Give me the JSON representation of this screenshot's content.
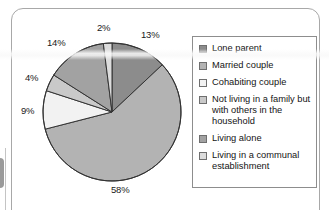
{
  "chart_data": {
    "type": "pie",
    "title": "",
    "subtitle": "",
    "xlabel": "",
    "ylabel": "",
    "legend_position": "right",
    "grid": false,
    "unit": "%",
    "categories": [
      "Lone parent",
      "Married couple",
      "Cohabiting couple",
      "Not living in a family but with others in the household",
      "Living alone",
      "Living in a communal establishment"
    ],
    "values": [
      13,
      58,
      9,
      4,
      14,
      2
    ],
    "data_labels": [
      "13%",
      "58%",
      "9%",
      "4%",
      "14%",
      "2%"
    ],
    "colors": [
      "#8c8c8c",
      "#b3b3b3",
      "#f2f2f2",
      "#c9c9c9",
      "#a2a2a2",
      "#dcdcdc"
    ],
    "slice_order_clockwise_from_top": [
      "Lone parent",
      "Married couple",
      "Cohabiting couple",
      "Not living in a family but with others in the household",
      "Living alone",
      "Living in a communal establishment"
    ],
    "slices": [
      {
        "label": "Lone parent",
        "value": 13,
        "data_label": "13%",
        "color": "#8c8c8c"
      },
      {
        "label": "Married couple",
        "value": 58,
        "data_label": "58%",
        "color": "#b3b3b3"
      },
      {
        "label": "Cohabiting couple",
        "value": 9,
        "data_label": "9%",
        "color": "#f2f2f2"
      },
      {
        "label": "Not living in a family but with others in the household",
        "value": 4,
        "data_label": "4%",
        "color": "#c9c9c9"
      },
      {
        "label": "Living alone",
        "value": 14,
        "data_label": "14%",
        "color": "#a2a2a2"
      },
      {
        "label": "Living in a communal establishment",
        "value": 2,
        "data_label": "2%",
        "color": "#dcdcdc"
      }
    ]
  },
  "labels": {
    "p13": "13%",
    "p58": "58%",
    "p9": "9%",
    "p4": "4%",
    "p14": "14%",
    "p2": "2%"
  },
  "legend": {
    "items": [
      {
        "label": "Lone parent",
        "color": "#8c8c8c"
      },
      {
        "label": "Married couple",
        "color": "#b3b3b3"
      },
      {
        "label": "Cohabiting couple",
        "color": "#f2f2f2"
      },
      {
        "label": "Not living in a family but with others in the household",
        "color": "#c9c9c9"
      },
      {
        "label": "Living alone",
        "color": "#a2a2a2"
      },
      {
        "label": "Living in a communal establishment",
        "color": "#dcdcdc"
      }
    ]
  },
  "style": {
    "slice_outline": "#333333",
    "legend_border": "#8d8d8d",
    "frame_border": "#a8a8a8",
    "text_color": "#141414",
    "background": "#ffffff"
  }
}
